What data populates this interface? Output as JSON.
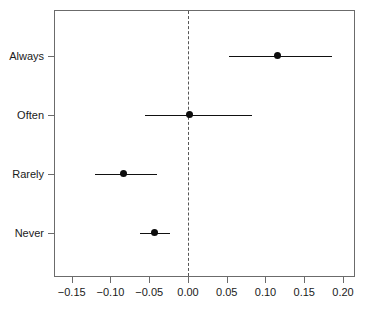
{
  "chart_data": {
    "type": "scatter",
    "subtype": "forest-plot",
    "title": "",
    "xlabel": "",
    "ylabel": "",
    "xlim": [
      -0.1716,
      0.2168
    ],
    "xticks": [
      -0.15,
      -0.1,
      -0.05,
      0.0,
      0.05,
      0.1,
      0.15,
      0.2
    ],
    "xticklabels": [
      "−0.15",
      "−0.10",
      "−0.05",
      "0.00",
      "0.05",
      "0.10",
      "0.15",
      "0.20"
    ],
    "categories": [
      "Always",
      "Often",
      "Rarely",
      "Never"
    ],
    "grid": false,
    "legend": null,
    "reference_line": {
      "x": 0.0,
      "style": "dashed",
      "color": "#555555"
    },
    "point_color": "#0d0d0d",
    "line_color": "#111111",
    "frame_color": "#6b6b6b",
    "points": [
      {
        "label": "Always",
        "estimate": 0.115,
        "ci_low": 0.053,
        "ci_high": 0.186
      },
      {
        "label": "Often",
        "estimate": 0.002,
        "ci_low": -0.056,
        "ci_high": 0.083
      },
      {
        "label": "Rarely",
        "estimate": -0.083,
        "ci_low": -0.12,
        "ci_high": -0.04
      },
      {
        "label": "Never",
        "estimate": -0.043,
        "ci_low": -0.062,
        "ci_high": -0.023
      }
    ]
  }
}
